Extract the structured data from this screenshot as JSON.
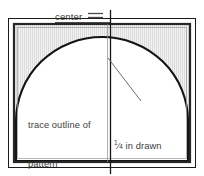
{
  "diagram": {
    "width": 204,
    "height": 176,
    "colors": {
      "outline": "#1a1a1a",
      "border": "#2b2b2b",
      "fabric_fill": "#efefef",
      "stripe": "#d8d8d8",
      "arch_fill": "#ffffff",
      "text": "#3d3d3d",
      "center_line": "#1a1a1a",
      "leader_line": "#555555",
      "background": "#ffffff"
    }
  },
  "labels": {
    "center": "center",
    "trace_line1": "trace outline of",
    "trace_line2": "pattern",
    "placement_fraction_numerator": "1",
    "placement_fraction_denominator": "4",
    "placement_line1_suffix": " in drawn",
    "placement_line2": "placement line"
  },
  "shapes": {
    "outer_rect": {
      "x": 8,
      "y": 18,
      "width": 188,
      "height": 150
    },
    "inner_rect": {
      "x": 14,
      "y": 24,
      "width": 176,
      "height": 138
    },
    "arch": {
      "cx": 102,
      "base_y": 160,
      "radius_x": 86,
      "radius_y": 78
    },
    "center_line": {
      "x": 110,
      "y_top": 10,
      "y_bottom": 174
    },
    "center_underline": {
      "x1": 55,
      "x2": 110,
      "y": 22
    },
    "equals_mark": {
      "x1": 88,
      "x2": 103,
      "y_top": 13,
      "y_bottom": 17
    },
    "leader_line": {
      "x1": 108,
      "y1": 58,
      "x2": 141,
      "y2": 101
    }
  }
}
